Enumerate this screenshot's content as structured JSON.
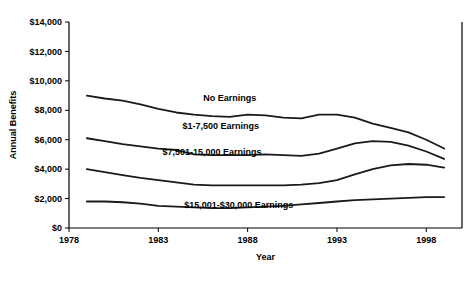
{
  "chart_data": {
    "type": "line",
    "title": "",
    "xlabel": "Year",
    "ylabel": "Annual Benefits",
    "xlim": [
      1978,
      2000
    ],
    "ylim": [
      0,
      14000
    ],
    "grid": false,
    "legend_position": "inline-labels",
    "xticks": [
      "1978",
      "1983",
      "1988",
      "1993",
      "1998"
    ],
    "xtick_values": [
      1978,
      1983,
      1988,
      1993,
      1998
    ],
    "yticks": [
      "$0",
      "$2,000",
      "$4,000",
      "$6,000",
      "$8,000",
      "$10,000",
      "$12,000",
      "$14,000"
    ],
    "ytick_values": [
      0,
      2000,
      4000,
      6000,
      8000,
      10000,
      12000,
      14000
    ],
    "x": [
      1979,
      1980,
      1981,
      1982,
      1983,
      1984,
      1985,
      1986,
      1987,
      1988,
      1989,
      1990,
      1991,
      1992,
      1993,
      1994,
      1995,
      1996,
      1997,
      1998,
      1999
    ],
    "series": [
      {
        "name": "No Earnings",
        "label": "No Earnings",
        "label_x": 1987.0,
        "label_y": 8600,
        "values": [
          9000,
          8800,
          8650,
          8400,
          8100,
          7850,
          7700,
          7600,
          7550,
          7700,
          7650,
          7500,
          7450,
          7700,
          7700,
          7500,
          7100,
          6800,
          6500,
          6000,
          5400
        ]
      },
      {
        "name": "$1-7,500 Earnings",
        "label": "$1-7,500 Earnings",
        "label_x": 1986.5,
        "label_y": 6750,
        "values": [
          6100,
          5900,
          5700,
          5550,
          5400,
          5300,
          5000,
          4950,
          4950,
          4950,
          5000,
          4950,
          4900,
          5050,
          5400,
          5750,
          5900,
          5850,
          5600,
          5200,
          4700
        ]
      },
      {
        "name": "$7,501-15,000 Earnings",
        "label": "$7,501-15,000 Earnings",
        "label_x": 1986.0,
        "label_y": 4950,
        "values": [
          4000,
          3800,
          3600,
          3400,
          3250,
          3100,
          2950,
          2900,
          2900,
          2900,
          2900,
          2900,
          2950,
          3050,
          3250,
          3650,
          4000,
          4250,
          4350,
          4300,
          4100
        ]
      },
      {
        "name": "$15,001-$30,000 Earnings",
        "label": "$15,001-$30,000 Earnings",
        "label_x": 1987.5,
        "label_y": 1350,
        "values": [
          1800,
          1800,
          1750,
          1650,
          1500,
          1450,
          1400,
          1350,
          1350,
          1400,
          1450,
          1500,
          1600,
          1700,
          1800,
          1900,
          1950,
          2000,
          2050,
          2100,
          2100
        ]
      }
    ]
  },
  "caption": {
    "text": ""
  }
}
